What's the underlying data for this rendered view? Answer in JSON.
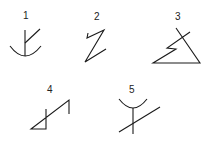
{
  "glyphs": [
    {
      "number": "1",
      "label_pos": [
        23,
        11
      ]
    },
    {
      "number": "2",
      "label_pos": [
        94,
        12
      ]
    },
    {
      "number": "3",
      "label_pos": [
        175,
        12
      ]
    },
    {
      "number": "4",
      "label_pos": [
        47,
        85
      ]
    },
    {
      "number": "5",
      "label_pos": [
        129,
        85
      ]
    }
  ],
  "colors": {
    "stroke": "#1a1a1a",
    "background": "#ffffff"
  }
}
